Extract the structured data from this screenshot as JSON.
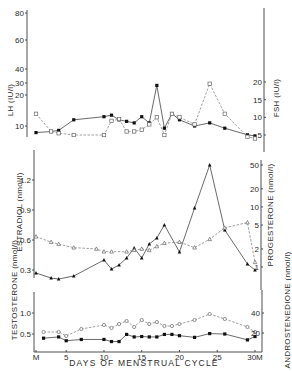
{
  "chart_data": {
    "type": "line",
    "title": "",
    "xlabel": "DAYS OF MENSTRUAL CYCLE",
    "x_ticks": [
      "M",
      "5",
      "10",
      "15",
      "20",
      "25",
      "30M"
    ],
    "x_tick_days": [
      1,
      5,
      10,
      15,
      20,
      25,
      30
    ],
    "xlim": [
      1,
      30
    ],
    "panels": [
      {
        "name": "gonadotropins",
        "left_axis": {
          "label": "LH (IU/l)",
          "ticks": [
            "10",
            "20",
            "30",
            "40",
            "60",
            "80"
          ],
          "tick_values": [
            10,
            20,
            30,
            40,
            60,
            80
          ]
        },
        "right_axis": {
          "label": "FSH (IU/l)",
          "ticks": [
            "5",
            "10",
            "15",
            "20"
          ],
          "tick_values": [
            5,
            10,
            15,
            20
          ]
        },
        "series": [
          {
            "name": "LH",
            "marker": "filled-square",
            "line": "solid",
            "axis": "left",
            "x": [
              1,
              3,
              4,
              6,
              10,
              11,
              12,
              13,
              14,
              15,
              16,
              17,
              18,
              19,
              20,
              22,
              24,
              26,
              29,
              30
            ],
            "y": [
              7,
              7.5,
              8,
              12,
              13,
              13.5,
              12,
              11.5,
              11,
              13,
              11,
              28,
              9,
              14,
              12,
              10,
              11,
              9,
              6,
              5.5
            ]
          },
          {
            "name": "FSH",
            "marker": "open-square",
            "line": "dashed",
            "axis": "right",
            "x": [
              1,
              3,
              4,
              6,
              10,
              11,
              12,
              13,
              14,
              15,
              16,
              17,
              18,
              19,
              20,
              22,
              24,
              26,
              29,
              30
            ],
            "y": [
              11,
              6,
              5.5,
              5,
              5,
              9,
              9.5,
              6,
              6,
              6.5,
              8,
              10,
              5,
              11,
              10,
              8,
              19.5,
              11,
              4.5,
              4
            ]
          }
        ]
      },
      {
        "name": "steroids",
        "left_axis": {
          "label": "ESTRADIOL (nmol/l)",
          "ticks": [
            "0.3",
            "0.6",
            "0.9",
            "1.2"
          ],
          "tick_values": [
            0.3,
            0.6,
            0.9,
            1.2
          ]
        },
        "right_axis": {
          "label": "PROGESTERONE (nmol/l)",
          "ticks": [
            "1",
            "2",
            "5",
            "10",
            "20",
            "50"
          ],
          "tick_values": [
            1,
            2,
            5,
            10,
            20,
            50
          ]
        },
        "series": [
          {
            "name": "Estradiol",
            "marker": "filled-triangle",
            "line": "solid",
            "axis": "left",
            "x": [
              1,
              3,
              4,
              6,
              10,
              11,
              12,
              13,
              14,
              15,
              16,
              17,
              18,
              20,
              22,
              24,
              26,
              29,
              30
            ],
            "y": [
              0.27,
              0.22,
              0.21,
              0.24,
              0.4,
              0.31,
              0.35,
              0.42,
              0.52,
              0.42,
              0.56,
              0.62,
              0.75,
              0.48,
              0.92,
              1.35,
              0.7,
              0.36,
              0.3
            ]
          },
          {
            "name": "Progesterone",
            "marker": "open-triangle",
            "line": "dashed",
            "axis": "right",
            "x": [
              1,
              3,
              4,
              6,
              9,
              10,
              11,
              13,
              14,
              15,
              16,
              17,
              18,
              20,
              22,
              24,
              26,
              29,
              30
            ],
            "y": [
              3.2,
              2.6,
              2.4,
              2.1,
              2.0,
              1.8,
              1.8,
              1.8,
              1.9,
              2.0,
              1.9,
              2.2,
              2.5,
              2.6,
              2.1,
              2.9,
              4.5,
              5.5,
              1.2
            ]
          }
        ]
      },
      {
        "name": "androgens",
        "left_axis": {
          "label": "TESTOSTERONE (nmol/l)",
          "ticks": [
            "0.5",
            "1.0"
          ],
          "tick_values": [
            0.5,
            1.0
          ]
        },
        "right_axis": {
          "label": "ANDROSTENEDIONE (nmol/l)",
          "ticks": [
            "20",
            "40"
          ],
          "tick_values": [
            20,
            40
          ]
        },
        "series": [
          {
            "name": "Testosterone",
            "marker": "filled-square",
            "line": "solid",
            "axis": "left",
            "x": [
              2,
              4,
              5,
              7,
              10,
              11,
              12,
              13,
              14,
              15,
              16,
              17,
              18,
              19,
              20,
              22,
              24,
              26,
              29,
              30
            ],
            "y": [
              0.4,
              0.43,
              0.34,
              0.37,
              0.37,
              0.32,
              0.32,
              0.49,
              0.43,
              0.44,
              0.43,
              0.43,
              0.49,
              0.49,
              0.46,
              0.42,
              0.51,
              0.5,
              0.36,
              0.44
            ]
          },
          {
            "name": "Androstenedione",
            "marker": "open-circle",
            "line": "dashed",
            "axis": "right",
            "x": [
              2,
              4,
              5,
              7,
              10,
              11,
              12,
              13,
              14,
              15,
              16,
              17,
              18,
              19,
              20,
              22,
              24,
              26,
              29,
              30
            ],
            "y": [
              21,
              21,
              17,
              24,
              28,
              25,
              29,
              32,
              26,
              33,
              29,
              31,
              27,
              27,
              29,
              33,
              39,
              34,
              26,
              21
            ]
          }
        ]
      }
    ],
    "grid": false,
    "legend": "none"
  },
  "labels": {
    "lh": "LH (IU/l)",
    "fsh": "FSH (IU/l)",
    "estradiol": "ESTRADIOL (nmol/l)",
    "progesterone": "PROGESTERONE (nmol/l)",
    "testosterone": "TESTOSTERONE (nmol/l)",
    "androstenedione": "ANDROSTENEDIONE (nmol/l)",
    "x_axis": "DAYS OF MENSTRUAL CYCLE"
  }
}
